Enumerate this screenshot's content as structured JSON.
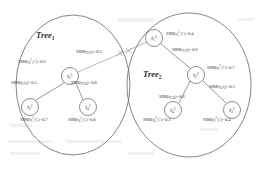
{
  "figure": {
    "type": "diagram",
    "groups": [
      {
        "id": "tree1",
        "title": "Tree",
        "title_sub": "1"
      },
      {
        "id": "tree2",
        "title": "Tree",
        "title_sub": "2"
      }
    ]
  },
  "nodes": [
    {
      "id": "t2_1",
      "base": "t",
      "sub": "2",
      "sup": "1",
      "tree": "tree1",
      "cx": 70,
      "cy": 76,
      "r": 8.5
    },
    {
      "id": "t3_1",
      "base": "t",
      "sub": "3",
      "sup": "1",
      "tree": "tree1",
      "cx": 30,
      "cy": 107,
      "r": 8.5
    },
    {
      "id": "t4_1",
      "base": "t",
      "sub": "4",
      "sup": "1",
      "tree": "tree1",
      "cx": 88,
      "cy": 107,
      "r": 8.5
    },
    {
      "id": "t1_2",
      "base": "t",
      "sub": "1",
      "sup": "2",
      "tree": "tree2",
      "cx": 154,
      "cy": 38,
      "r": 8.5
    },
    {
      "id": "t2_2",
      "base": "t",
      "sub": "2",
      "sup": "2",
      "tree": "tree2",
      "cx": 196,
      "cy": 75,
      "r": 8.5
    },
    {
      "id": "t4_2",
      "base": "t",
      "sub": "4",
      "sup": "2",
      "tree": "tree2",
      "cx": 173,
      "cy": 110,
      "r": 8.5
    },
    {
      "id": "t3_2",
      "base": "t",
      "sub": "3",
      "sup": "2",
      "tree": "tree2",
      "cx": 232,
      "cy": 110,
      "r": 8.5
    }
  ],
  "labels": {
    "sim_t2_1_C": {
      "fn": "SIM",
      "args": "t",
      "arg_sub": "2",
      "arg_sup": "1",
      "arg2": "C",
      "value": "0.6",
      "text": "SIM(t21,C)=0.6"
    },
    "sim_t2_t3_tree1": {
      "fn": "SIM",
      "args": "t2,t3",
      "value": "0.5",
      "text": "SIM(t2,t3)=0.5"
    },
    "sim_t2_t4_tree1": {
      "fn": "SIM",
      "args": "t2,t4",
      "value": "0.8",
      "text": "SIM(t2,t4)=0.8"
    },
    "sim_t3_1_C": {
      "fn": "SIM",
      "args": "t",
      "arg_sub": "3",
      "arg_sup": "1",
      "arg2": "C",
      "value": "0.7",
      "text": "SIM(t31,C)=0.7"
    },
    "sim_t4_1_C": {
      "fn": "SIM",
      "args": "t",
      "arg_sub": "4",
      "arg_sup": "1",
      "arg2": "C",
      "value": "0.8",
      "text": "SIM(t41,C)=0.8"
    },
    "sim_cross": {
      "fn": "SIM",
      "args": "t2,t1",
      "value": "0.3",
      "text": "SIM(t2,t1)=0.3"
    },
    "sim_t1_2_C": {
      "fn": "SIM",
      "args": "t",
      "arg_sub": "1",
      "arg_sup": "2",
      "arg2": "C",
      "value": "0.4",
      "text": "SIM(t12,C)=0.4"
    },
    "sim_t1_t2_tree2": {
      "fn": "SIM",
      "args": "t1,t2",
      "value": "0.6",
      "text": "SIM(t1,t2)=0.6"
    },
    "sim_t2_2_C": {
      "fn": "SIM",
      "args": "t",
      "arg_sub": "2",
      "arg_sup": "2",
      "arg2": "C",
      "value": "0.7",
      "text": "SIM(t22,C)=0.7"
    },
    "sim_t2_t3_tree2": {
      "fn": "SIM",
      "args": "t2,t3",
      "value": "0.5",
      "text": "SIM(t2,t3)=0.5"
    },
    "sim_t2_t4_tree2": {
      "fn": "SIM",
      "args": "t2,t4",
      "value": "0.6",
      "text": "SIM(t2,t4)=0.6"
    },
    "sim_t4_2_C": {
      "fn": "SIM",
      "args": "t",
      "arg_sub": "4",
      "arg_sup": "2",
      "arg2": "C",
      "value": "0.3",
      "text": "SIM(t42,C)=0.3"
    },
    "sim_t3_2_C": {
      "fn": "SIM",
      "args": "t",
      "arg_sub": "3",
      "arg_sup": "2",
      "arg2": "C",
      "value": "0.4",
      "text": "SIM(t32,C)=0.4"
    }
  },
  "parts": {
    "sim": "SIM",
    "open": "(",
    "close": ")",
    "comma": ",",
    "eq": "=",
    "t": "t",
    "C": "C",
    "v06": "0.6",
    "v05": "0.5",
    "v08": "0.8",
    "v07": "0.7",
    "v03": "0.3",
    "v04": "0.4"
  },
  "colors": {
    "stroke": "#6f6f6f",
    "text": "#3a3a3a",
    "background": "#ffffff"
  }
}
